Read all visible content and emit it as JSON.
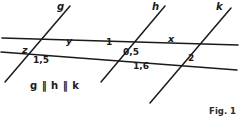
{
  "figure": {
    "caption": "Fig. 1",
    "parallel_note": "g ‖ h ‖ k",
    "background_color": "#ffffff",
    "stroke_color": "#1a1a1a",
    "line_labels": [
      {
        "id": "g",
        "text": "g",
        "x": 57,
        "y": 2
      },
      {
        "id": "h",
        "text": "h",
        "x": 152,
        "y": 2
      },
      {
        "id": "k",
        "text": "k",
        "x": 216,
        "y": 2
      }
    ],
    "angle_labels": [
      {
        "id": "z",
        "text": "z",
        "x": 22,
        "y": 45
      },
      {
        "id": "y",
        "text": "y",
        "x": 66,
        "y": 36
      },
      {
        "id": "one",
        "text": "1",
        "x": 106,
        "y": 38
      },
      {
        "id": "x",
        "text": "x",
        "x": 168,
        "y": 34
      },
      {
        "id": "two",
        "text": "2",
        "x": 188,
        "y": 54
      }
    ],
    "value_labels": [
      {
        "id": "v15",
        "text": "1,5",
        "x": 33,
        "y": 56
      },
      {
        "id": "v05",
        "text": "0,5",
        "x": 123,
        "y": 48
      },
      {
        "id": "v16",
        "text": "1,6",
        "x": 133,
        "y": 62
      }
    ],
    "geometry": {
      "parallel_lines": [
        {
          "id": "g",
          "x1": 5,
          "y1": 82,
          "x2": 70,
          "y2": 6
        },
        {
          "id": "h",
          "x1": 101,
          "y1": 82,
          "x2": 165,
          "y2": 6
        },
        {
          "id": "k",
          "x1": 150,
          "y1": 103,
          "x2": 231,
          "y2": 8
        }
      ],
      "transversals": [
        {
          "id": "t-upper",
          "x1": 2,
          "y1": 38,
          "x2": 238,
          "y2": 45
        },
        {
          "id": "t-lower",
          "x1": 1,
          "y1": 52,
          "x2": 237,
          "y2": 70
        }
      ]
    }
  }
}
